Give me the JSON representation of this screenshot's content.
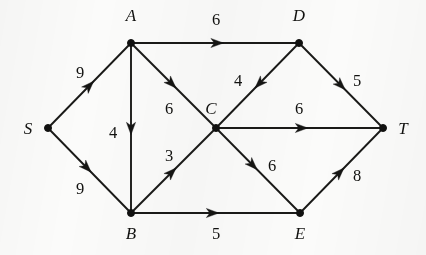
{
  "figure": {
    "type": "directed-weighted-graph",
    "title": "",
    "background_color": "#fbfbfa",
    "ink_color": "#121210"
  },
  "nodes": [
    {
      "id": "S",
      "label": "S",
      "x": 48,
      "y": 128,
      "label_x": 28,
      "label_y": 134
    },
    {
      "id": "A",
      "label": "A",
      "x": 131,
      "y": 43,
      "label_x": 131,
      "label_y": 21
    },
    {
      "id": "B",
      "label": "B",
      "x": 131,
      "y": 213,
      "label_x": 131,
      "label_y": 239
    },
    {
      "id": "C",
      "label": "C",
      "x": 216,
      "y": 128,
      "label_x": 211,
      "label_y": 114
    },
    {
      "id": "D",
      "label": "D",
      "x": 299,
      "y": 43,
      "label_x": 299,
      "label_y": 21
    },
    {
      "id": "E",
      "label": "E",
      "x": 300,
      "y": 213,
      "label_x": 300,
      "label_y": 239
    },
    {
      "id": "T",
      "label": "T",
      "x": 383,
      "y": 128,
      "label_x": 403,
      "label_y": 134
    }
  ],
  "edges": [
    {
      "from": "S",
      "to": "A",
      "weight": "9",
      "label_x": 80,
      "label_y": 78,
      "arrow_t": 0.55
    },
    {
      "from": "S",
      "to": "B",
      "weight": "9",
      "label_x": 80,
      "label_y": 194,
      "arrow_t": 0.52
    },
    {
      "from": "A",
      "to": "D",
      "weight": "6",
      "label_x": 216,
      "label_y": 25,
      "arrow_t": 0.55
    },
    {
      "from": "A",
      "to": "B",
      "weight": "4",
      "label_x": 113,
      "label_y": 138,
      "arrow_t": 0.54
    },
    {
      "from": "A",
      "to": "C",
      "weight": "6",
      "label_x": 169,
      "label_y": 114,
      "arrow_t": 0.53
    },
    {
      "from": "B",
      "to": "C",
      "weight": "3",
      "label_x": 169,
      "label_y": 161,
      "arrow_t": 0.53
    },
    {
      "from": "D",
      "to": "C",
      "weight": "4",
      "label_x": 238,
      "label_y": 86,
      "arrow_t": 0.53
    },
    {
      "from": "D",
      "to": "T",
      "weight": "5",
      "label_x": 357,
      "label_y": 86,
      "arrow_t": 0.55
    },
    {
      "from": "C",
      "to": "T",
      "weight": "6",
      "label_x": 299,
      "label_y": 114,
      "arrow_t": 0.55
    },
    {
      "from": "C",
      "to": "E",
      "weight": "6",
      "label_x": 272,
      "label_y": 171,
      "arrow_t": 0.49
    },
    {
      "from": "B",
      "to": "E",
      "weight": "5",
      "label_x": 216,
      "label_y": 239,
      "arrow_t": 0.52
    },
    {
      "from": "E",
      "to": "T",
      "weight": "8",
      "label_x": 357,
      "label_y": 181,
      "arrow_t": 0.53
    }
  ]
}
